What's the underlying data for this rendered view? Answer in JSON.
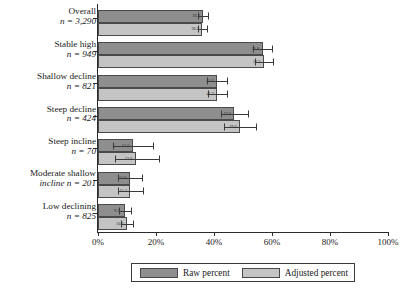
{
  "chart_data": {
    "type": "bar",
    "orientation": "horizontal",
    "title": "",
    "xlabel": "",
    "ylabel": "",
    "xlim": [
      0,
      100
    ],
    "xticks": [
      "0%",
      "20%",
      "40%",
      "60%",
      "80%",
      "100%"
    ],
    "xtick_values": [
      0,
      20,
      40,
      60,
      80,
      100
    ],
    "grid": false,
    "legend_position": "bottom",
    "categories": [
      "Overall",
      "Stable high",
      "Shallow decline",
      "Steep decline",
      "Steep incline",
      "Moderate shallow incline",
      "Low declining"
    ],
    "category_n_labels": [
      "n = 3,290",
      "n = 949",
      "n = 821",
      "n = 424",
      "n = 70",
      "n = 201",
      "n = 825"
    ],
    "category_n_values": [
      3290,
      949,
      821,
      424,
      70,
      201,
      825
    ],
    "series": [
      {
        "name": "Raw percent",
        "color": "#8e8e8e",
        "values": [
          36.3,
          56.8,
          41.0,
          47.0,
          12.0,
          11.0,
          9.3
        ],
        "error_low": [
          34.6,
          53.6,
          37.6,
          42.4,
          5.0,
          6.9,
          7.3
        ],
        "error_high": [
          38.0,
          60.0,
          44.4,
          51.6,
          19.0,
          15.1,
          11.3
        ]
      },
      {
        "name": "Adjusted percent",
        "color": "#c4c4c4",
        "values": [
          36.0,
          57.2,
          41.2,
          49.0,
          13.0,
          11.2,
          10.0
        ],
        "error_low": [
          34.4,
          54.0,
          37.8,
          43.5,
          5.8,
          7.0,
          7.9
        ],
        "error_high": [
          37.6,
          60.4,
          44.6,
          54.5,
          21.0,
          15.4,
          12.1
        ]
      }
    ]
  },
  "legend": {
    "items": [
      {
        "label": "Raw percent",
        "swatch": "raw"
      },
      {
        "label": "Adjusted percent",
        "swatch": "adj"
      }
    ]
  }
}
